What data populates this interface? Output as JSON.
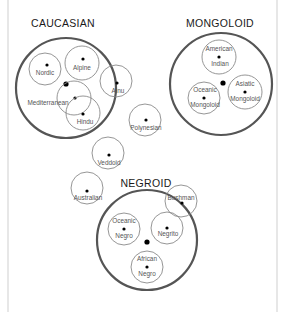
{
  "diagram": {
    "groups": [
      {
        "id": "caucasian",
        "label": "CAUCASIAN",
        "members": [
          {
            "id": "nordic",
            "lines": [
              "Nordic"
            ]
          },
          {
            "id": "alpine",
            "lines": [
              "Alpine"
            ]
          },
          {
            "id": "mediterranean",
            "lines": [
              "Mediterranean"
            ]
          },
          {
            "id": "hindu",
            "lines": [
              "Hindu"
            ]
          },
          {
            "id": "ainu",
            "lines": [
              "Ainu"
            ]
          }
        ]
      },
      {
        "id": "mongoloid",
        "label": "MONGOLOID",
        "members": [
          {
            "id": "american-indian",
            "lines": [
              "American",
              "Indian"
            ]
          },
          {
            "id": "oceanic-mongoloid",
            "lines": [
              "Oceanic",
              "Mongoloid"
            ]
          },
          {
            "id": "asiatic-mongoloid",
            "lines": [
              "Asiatic",
              "Mongoloid"
            ]
          }
        ]
      },
      {
        "id": "negroid",
        "label": "NEGROID",
        "members": [
          {
            "id": "bushman",
            "lines": [
              "Bushman"
            ]
          },
          {
            "id": "oceanic-negro",
            "lines": [
              "Oceanic",
              "Negro"
            ]
          },
          {
            "id": "negrito",
            "lines": [
              "Negrito"
            ]
          },
          {
            "id": "african-negro",
            "lines": [
              "African",
              "Negro"
            ]
          }
        ]
      }
    ],
    "independent": [
      {
        "id": "polynesian",
        "lines": [
          "Polynesian"
        ]
      },
      {
        "id": "veddoid",
        "lines": [
          "Veddoid"
        ]
      },
      {
        "id": "australian",
        "lines": [
          "Australian"
        ]
      }
    ]
  }
}
